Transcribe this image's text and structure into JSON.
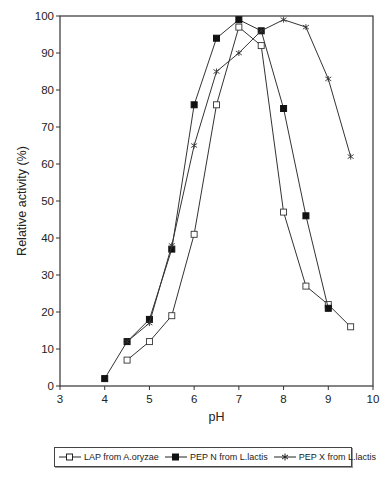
{
  "chart_data": {
    "type": "line",
    "title": "",
    "xlabel": "pH",
    "ylabel": "Relative activity (%)",
    "xlim": [
      3,
      10
    ],
    "ylim": [
      0,
      100
    ],
    "xticks": [
      3,
      4,
      5,
      6,
      7,
      8,
      9,
      10
    ],
    "yticks": [
      0,
      10,
      20,
      30,
      40,
      50,
      60,
      70,
      80,
      90,
      100
    ],
    "grid": false,
    "legend_position": "bottom",
    "series": [
      {
        "name": "LAP from A.oryzae",
        "marker": "open-square",
        "x": [
          4.5,
          5,
          5.5,
          6,
          6.5,
          7,
          7.5,
          8,
          8.5,
          9,
          9.5
        ],
        "y": [
          7,
          12,
          19,
          41,
          76,
          97,
          92,
          47,
          27,
          22,
          16
        ]
      },
      {
        "name": "PEP N from L.lactis",
        "marker": "filled-square",
        "x": [
          4,
          4.5,
          5,
          5.5,
          6,
          6.5,
          7,
          7.5,
          8,
          8.5,
          9
        ],
        "y": [
          2,
          12,
          18,
          37,
          76,
          94,
          99,
          96,
          75,
          46,
          21
        ]
      },
      {
        "name": "PEP X from L.lactis",
        "marker": "star",
        "x": [
          4.5,
          5,
          5.5,
          6,
          6.5,
          7,
          7.5,
          8,
          8.5,
          9,
          9.5
        ],
        "y": [
          12,
          17,
          38,
          65,
          85,
          90,
          96,
          99,
          97,
          83,
          62
        ]
      }
    ]
  },
  "legend": {
    "items": [
      {
        "label": "LAP from A.oryzae"
      },
      {
        "label": "PEP N from L.lactis"
      },
      {
        "label": "PEP X from L.lactis"
      }
    ]
  }
}
